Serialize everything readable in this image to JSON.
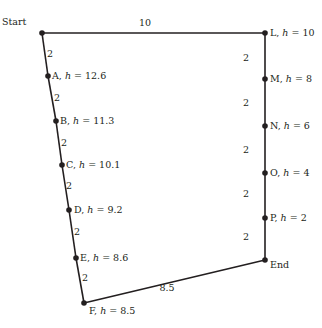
{
  "diagram": {
    "colors": {
      "line": "#231f20",
      "background": "#ffffff"
    },
    "nodes": [
      {
        "id": "start",
        "label": "Start",
        "h": null,
        "x": 42,
        "y": 33,
        "lx": 2,
        "ly": 25,
        "anchor": "start"
      },
      {
        "id": "A",
        "label": "A",
        "h": "12.6",
        "x": 48,
        "y": 76,
        "lx": 52,
        "ly": 79
      },
      {
        "id": "B",
        "label": "B",
        "h": "11.3",
        "x": 56,
        "y": 121,
        "lx": 60,
        "ly": 124
      },
      {
        "id": "C",
        "label": "C",
        "h": "10.1",
        "x": 62,
        "y": 165,
        "lx": 66,
        "ly": 168
      },
      {
        "id": "D",
        "label": "D",
        "h": "9.2",
        "x": 69,
        "y": 210,
        "lx": 74,
        "ly": 213
      },
      {
        "id": "E",
        "label": "E",
        "h": "8.6",
        "x": 76,
        "y": 258,
        "lx": 80,
        "ly": 261
      },
      {
        "id": "F",
        "label": "F",
        "h": "8.5",
        "x": 84,
        "y": 303,
        "lx": 89,
        "ly": 314
      },
      {
        "id": "L",
        "label": "L",
        "h": "10",
        "x": 265,
        "y": 33,
        "lx": 270,
        "ly": 36
      },
      {
        "id": "M",
        "label": "M",
        "h": "8",
        "x": 265,
        "y": 79,
        "lx": 270,
        "ly": 82
      },
      {
        "id": "N",
        "label": "N",
        "h": "6",
        "x": 265,
        "y": 126,
        "lx": 270,
        "ly": 129
      },
      {
        "id": "O",
        "label": "O",
        "h": "4",
        "x": 265,
        "y": 173,
        "lx": 270,
        "ly": 176
      },
      {
        "id": "P",
        "label": "P",
        "h": "2",
        "x": 265,
        "y": 218,
        "lx": 270,
        "ly": 221
      },
      {
        "id": "end",
        "label": "End",
        "h": null,
        "x": 265,
        "y": 260,
        "lx": 270,
        "ly": 268
      }
    ],
    "edges": [
      {
        "from": "start",
        "to": "A",
        "length": "2",
        "lx": 50,
        "ly": 57
      },
      {
        "from": "A",
        "to": "B",
        "length": "2",
        "lx": 57,
        "ly": 101
      },
      {
        "from": "B",
        "to": "C",
        "length": "2",
        "lx": 64,
        "ly": 146
      },
      {
        "from": "C",
        "to": "D",
        "length": "2",
        "lx": 69,
        "ly": 189
      },
      {
        "from": "D",
        "to": "E",
        "length": "2",
        "lx": 77,
        "ly": 235
      },
      {
        "from": "E",
        "to": "F",
        "length": "2",
        "lx": 85,
        "ly": 281
      },
      {
        "from": "F",
        "to": "end",
        "length": "8.5",
        "lx": 167,
        "ly": 291
      },
      {
        "from": "start",
        "to": "L",
        "length": "10",
        "lx": 145,
        "ly": 26
      },
      {
        "from": "L",
        "to": "M",
        "length": "2",
        "lx": 246,
        "ly": 61
      },
      {
        "from": "M",
        "to": "N",
        "length": "2",
        "lx": 246,
        "ly": 106
      },
      {
        "from": "N",
        "to": "O",
        "length": "2",
        "lx": 246,
        "ly": 153
      },
      {
        "from": "O",
        "to": "P",
        "length": "2",
        "lx": 246,
        "ly": 197
      },
      {
        "from": "P",
        "to": "end",
        "length": "2",
        "lx": 246,
        "ly": 240
      }
    ],
    "head_symbol": "h",
    "equals": " = "
  }
}
